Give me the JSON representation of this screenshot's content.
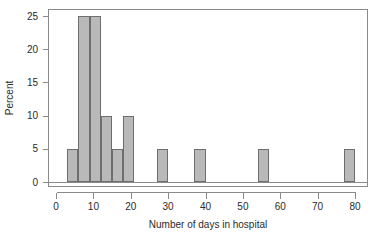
{
  "chart_data": {
    "type": "bar",
    "title": "",
    "subtitle": "",
    "xlabel": "Number of days in hospital",
    "ylabel": "Percent",
    "xlim": [
      0,
      82
    ],
    "ylim": [
      0,
      26
    ],
    "xticks": [
      0,
      10,
      20,
      30,
      40,
      50,
      60,
      70,
      80
    ],
    "xtick_labels": [
      "0",
      "10",
      "20",
      "30",
      "40",
      "50",
      "60",
      "70",
      "80"
    ],
    "yticks": [
      0,
      5,
      10,
      15,
      20,
      25
    ],
    "ytick_labels": [
      "0",
      "5",
      "10",
      "15",
      "20",
      "25"
    ],
    "grid": false,
    "legend": null,
    "bin_width": 3,
    "bar_fill": "#b9b9b9",
    "bar_stroke": "#6e6e6e",
    "bars": [
      {
        "bin_start": 3,
        "bin_end": 6,
        "center": 4.5,
        "value": 5
      },
      {
        "bin_start": 6,
        "bin_end": 9,
        "center": 7.5,
        "value": 25
      },
      {
        "bin_start": 9,
        "bin_end": 12,
        "center": 10.5,
        "value": 25
      },
      {
        "bin_start": 12,
        "bin_end": 15,
        "center": 13.5,
        "value": 10
      },
      {
        "bin_start": 15,
        "bin_end": 18,
        "center": 16.5,
        "value": 5
      },
      {
        "bin_start": 18,
        "bin_end": 21,
        "center": 19.5,
        "value": 10
      },
      {
        "bin_start": 27,
        "bin_end": 30,
        "center": 28.5,
        "value": 5
      },
      {
        "bin_start": 37,
        "bin_end": 40,
        "center": 38.5,
        "value": 5
      },
      {
        "bin_start": 54,
        "bin_end": 57,
        "center": 55.5,
        "value": 5
      },
      {
        "bin_start": 77,
        "bin_end": 80,
        "center": 78.5,
        "value": 5
      }
    ],
    "categories": [
      "3-6",
      "6-9",
      "9-12",
      "12-15",
      "15-18",
      "18-21",
      "27-30",
      "37-40",
      "54-57",
      "77-80"
    ],
    "values": [
      5,
      25,
      25,
      10,
      5,
      10,
      5,
      5,
      5,
      5
    ]
  }
}
